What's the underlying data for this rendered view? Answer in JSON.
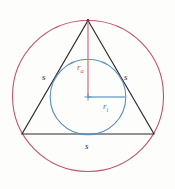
{
  "figure": {
    "labels": {
      "side_left": "s",
      "side_right": "s",
      "side_bottom": "s",
      "circumradius_main": "r",
      "circumradius_sub": "a",
      "inradius_main": "r",
      "inradius_sub": "i"
    },
    "colors": {
      "circumcircle": "#c0566b",
      "incircle": "#5a8fc0",
      "triangle": "#2b2b33",
      "circumradius_line": "#d4798c",
      "inradius_line": "#7aa8d0",
      "background": "#fdfdfb",
      "label_side": "#2b2b33",
      "label_circumradius": "#c0566b",
      "label_inradius": "#4a7fb5"
    },
    "geometry": {
      "circumcircle_center_x": 88,
      "circumcircle_center_y": 96,
      "circumcircle_radius": 76,
      "incircle_center_x": 88,
      "incircle_center_y": 97,
      "incircle_radius": 38,
      "apex_x": 88,
      "apex_y": 20,
      "bottom_left_x": 22,
      "bottom_left_y": 134,
      "bottom_right_x": 154,
      "bottom_right_y": 134
    }
  }
}
